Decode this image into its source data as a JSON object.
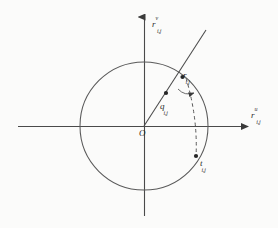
{
  "figure": {
    "type": "geometric-diagram",
    "background_color": "#fbfbfa",
    "stroke_color": "#4a4a4a",
    "text_color": "#2b2b2b",
    "origin_label": "O",
    "axes": {
      "vertical": {
        "name": "vertical-axis",
        "label_base": "r",
        "label_superscript": "v",
        "label_subscript": "i,j",
        "arrow": "up"
      },
      "horizontal": {
        "name": "horizontal-axis",
        "label_base": "r",
        "label_superscript": "u",
        "label_subscript": "i,j",
        "arrow": "right"
      }
    },
    "circle": {
      "name": "unit-circle",
      "center_x": 144,
      "center_y": 126,
      "radius": 64
    },
    "points": [
      {
        "name": "point-r",
        "label_base": "r",
        "label_subscript": "i,j",
        "x": 186,
        "y": 78
      },
      {
        "name": "point-q",
        "label_base": "q",
        "label_subscript": "i,j",
        "x": 171,
        "y": 96
      },
      {
        "name": "point-t",
        "label_base": "t",
        "label_subscript": "i,j",
        "x": 196,
        "y": 157
      }
    ],
    "ray": {
      "name": "vector-ray",
      "from_x": 144,
      "from_y": 126,
      "to_x": 206,
      "to_y": 30
    },
    "dashed_line": {
      "name": "dashed-chord",
      "from_x": 186,
      "from_y": 78,
      "to_x": 196,
      "to_y": 157
    },
    "angle_arc": {
      "name": "angle-arc",
      "vertex_x": 186,
      "vertex_y": 78
    }
  }
}
